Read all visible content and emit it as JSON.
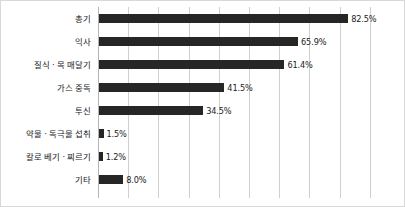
{
  "chart_data": {
    "type": "bar",
    "orientation": "horizontal",
    "title": "",
    "subtitle": "",
    "xlabel": "",
    "ylabel": "",
    "categories": [
      "총기",
      "익사",
      "질식 · 목 매달기",
      "가스 중독",
      "투신",
      "약물 · 독극물 섭취",
      "칼로 베기 · 찌르기",
      "기타"
    ],
    "values": [
      82.5,
      65.9,
      61.4,
      41.5,
      34.5,
      1.5,
      1.2,
      8.0
    ],
    "value_labels": [
      "82.5%",
      "65.9%",
      "61.4%",
      "41.5%",
      "34.5%",
      "1.5%",
      "1.2%",
      "8.0%"
    ],
    "unit": "%",
    "xlim": [
      0,
      96
    ],
    "grid": true,
    "gridline_interval": 10,
    "gridline_values": [
      0,
      10,
      20,
      30,
      40,
      50,
      60,
      70,
      80,
      90
    ],
    "tick_labels": [],
    "legend": [],
    "legend_position": "none",
    "colors": {
      "bar": "#262626",
      "gridline": "#cfcfcf",
      "axis": "#b4b4b4",
      "frame": "#d8d8d8",
      "text": "#1a1a1a",
      "background": "#ffffff"
    }
  }
}
